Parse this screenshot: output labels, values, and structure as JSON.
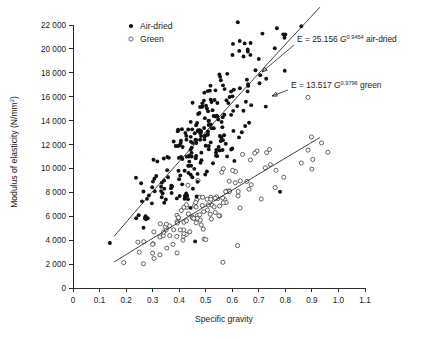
{
  "chart_data": {
    "type": "scatter",
    "title": "",
    "xlabel": "Specific gravity",
    "ylabel": "Modulus of elasticity (N/mm²)",
    "ylabel_base": "Modulus of elasticity (N/mm",
    "ylabel_sup": "2",
    "ylabel_close": ")",
    "xlim": [
      0,
      1.1
    ],
    "ylim": [
      0,
      22000
    ],
    "grid": false,
    "legend_position": "top-left-inside",
    "xticks": [
      "0",
      "0.1",
      "0.2",
      "0.3",
      "0.4",
      "0.5",
      "0.6",
      "0.7",
      "0.8",
      "0.9",
      "1.0",
      "1.1"
    ],
    "xtick_values": [
      0,
      0.1,
      0.2,
      0.3,
      0.4,
      0.5,
      0.6,
      0.7,
      0.8,
      0.9,
      1.0,
      1.1
    ],
    "yticks": [
      "0",
      "2 000",
      "4 000",
      "6 000",
      "8 000",
      "10 000",
      "12 000",
      "14 000",
      "16 000",
      "18 000",
      "20 000",
      "22 000"
    ],
    "ytick_values": [
      0,
      2000,
      4000,
      6000,
      8000,
      10000,
      12000,
      14000,
      16000,
      18000,
      20000,
      22000
    ],
    "series": [
      {
        "name": "Air-dried",
        "marker": "filled-circle",
        "color": "#111111",
        "n_points": 230,
        "fit": {
          "label_prefix": "E = ",
          "coefficient": "25.156",
          "variable": "G",
          "exponent": "0.9454",
          "suffix": " air-dried",
          "coefficient_value": 25.156,
          "exponent_value": 0.9454,
          "x_from": 0.155,
          "x_to": 0.93
        }
      },
      {
        "name": "Green",
        "marker": "open-circle",
        "color": "#333333",
        "n_points": 120,
        "fit": {
          "label_prefix": "E = ",
          "coefficient": "13.517",
          "variable": "G",
          "exponent": "0.9796",
          "suffix": " green",
          "coefficient_value": 13.517,
          "exponent_value": 0.9796,
          "x_from": 0.155,
          "x_to": 0.93
        }
      }
    ]
  },
  "legend": {
    "items": [
      {
        "label": "Air-dried",
        "marker": "filled-circle"
      },
      {
        "label": "Green",
        "marker": "open-circle"
      }
    ]
  },
  "annotations": [
    {
      "name": "air-dried-fit-annotation",
      "prefix": "E = ",
      "coefficient": "25.156 ",
      "variable": "G",
      "exponent": "0.9454",
      "suffix": " air-dried",
      "text_x": 297,
      "text_y": 42,
      "leader_from_x": 294,
      "leader_from_y": 45,
      "leader_to_x": 262,
      "leader_to_y": 72
    },
    {
      "name": "green-fit-annotation",
      "prefix": "E = ",
      "coefficient": "13.517 ",
      "variable": "G",
      "exponent": "0.9796",
      "suffix": " green",
      "text_x": 291,
      "text_y": 88,
      "leader_from_x": 288,
      "leader_from_y": 90,
      "leader_to_x": 272,
      "leader_to_y": 96
    }
  ]
}
